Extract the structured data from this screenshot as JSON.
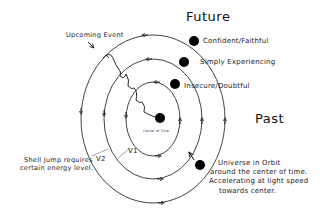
{
  "labels": {
    "future": "Future",
    "past": "Past",
    "upcoming_event": "Upcoming Event",
    "confident": "Confident/Faithful",
    "simply": "Simply Experiencing",
    "insecure": "Insecure/Doubtful",
    "center": "Center of Time",
    "shell_jump_line1": "Shell Jump requires",
    "shell_jump_line2": "certain energy level.",
    "v1": "V1",
    "v2": "V2",
    "universe_line1": "Universe in Orbit",
    "universe_line2": "around the center of time.",
    "universe_line3": "Accelerating at light speed",
    "universe_line4": "towards center."
  },
  "orbits": [
    {
      "name": "inner",
      "state": "Insecure/Doubtful",
      "rx": 27,
      "ry": 37
    },
    {
      "name": "middle",
      "state": "Simply Experiencing",
      "rx": 49,
      "ry": 60
    },
    {
      "name": "outer",
      "state": "Confident/Faithful",
      "rx": 72,
      "ry": 84
    }
  ],
  "colors": {
    "line": "#111111",
    "background": "#ffffff"
  }
}
